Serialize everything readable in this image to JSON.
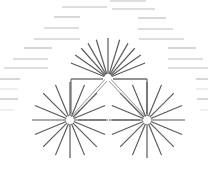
{
  "diagram": {
    "type": "network-graph",
    "width": 208,
    "height": 179,
    "background": "#ffffff",
    "colors": {
      "ray": "#5a5a5a",
      "edge": "#8a8a8a",
      "bracket": "#6e6e6e",
      "dash": "#bdbdbd",
      "node_center": "#ffffff"
    },
    "nodes": [
      {
        "id": "top",
        "x": 108,
        "y": 78,
        "rays": 12,
        "ray_inner": 4,
        "ray_outer": 40,
        "angles_deg": [
          -160,
          -145,
          -130,
          -115,
          -105,
          -90,
          -75,
          -62,
          -50,
          -38,
          -25,
          0,
          180
        ],
        "label": ""
      },
      {
        "id": "bottom-left",
        "x": 70,
        "y": 120,
        "rays": 16,
        "ray_inner": 4,
        "ray_outer": 38,
        "label": ""
      },
      {
        "id": "bottom-right",
        "x": 147,
        "y": 120,
        "rays": 16,
        "ray_inner": 4,
        "ray_outer": 38,
        "label": ""
      }
    ],
    "edges": [
      {
        "from": "top",
        "to": "bottom-left",
        "style": "double"
      },
      {
        "from": "top",
        "to": "bottom-right",
        "style": "double"
      }
    ],
    "bracket": {
      "top_y": 79,
      "left_x": 71,
      "right_x": 147,
      "bottom_y": 118,
      "gap_center_x": 108,
      "gap_width": 10
    },
    "base_line": {
      "y": 120,
      "x1": 78,
      "x2": 140,
      "gap_center_x": 109,
      "gap_width": 6
    },
    "dashes": [
      {
        "x1": 62,
        "x2": 107,
        "y": 7
      },
      {
        "x1": 112,
        "x2": 155,
        "y": 9
      },
      {
        "x1": 110,
        "x2": 146,
        "y": 1
      },
      {
        "x1": 54,
        "x2": 80,
        "y": 17
      },
      {
        "x1": 138,
        "x2": 166,
        "y": 18
      },
      {
        "x1": 44,
        "x2": 79,
        "y": 28
      },
      {
        "x1": 138,
        "x2": 173,
        "y": 29
      },
      {
        "x1": 34,
        "x2": 80,
        "y": 39
      },
      {
        "x1": 139,
        "x2": 184,
        "y": 39
      },
      {
        "x1": 24,
        "x2": 52,
        "y": 48
      },
      {
        "x1": 168,
        "x2": 196,
        "y": 48
      },
      {
        "x1": 13,
        "x2": 48,
        "y": 59
      },
      {
        "x1": 168,
        "x2": 203,
        "y": 59
      },
      {
        "x1": 4,
        "x2": 48,
        "y": 68
      },
      {
        "x1": 168,
        "x2": 208,
        "y": 68
      },
      {
        "x1": 0,
        "x2": 20,
        "y": 79
      },
      {
        "x1": 196,
        "x2": 208,
        "y": 79
      },
      {
        "x1": 0,
        "x2": 18,
        "y": 99
      },
      {
        "x1": 197,
        "x2": 208,
        "y": 99
      }
    ],
    "faint_dashes": [
      {
        "x1": 0,
        "x2": 18,
        "y": 89
      },
      {
        "x1": 196,
        "x2": 208,
        "y": 89
      },
      {
        "x1": 0,
        "x2": 14,
        "y": 110
      },
      {
        "x1": 200,
        "x2": 208,
        "y": 110
      }
    ]
  }
}
